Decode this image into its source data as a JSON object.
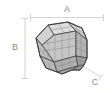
{
  "figure": {
    "background_color": "#ffffff",
    "canvas": {
      "width": 108,
      "height": 91
    }
  },
  "dimensions": {
    "width_label": "A",
    "height_label": "B",
    "depth_label": "C",
    "line_color": "#c9c9c9",
    "label_color": "#8c8c8c",
    "width_label_position": {
      "x": 67,
      "y": 9
    },
    "height_label_position": {
      "x": 15,
      "y": 48
    },
    "depth_label_position": {
      "x": 95,
      "y": 82
    },
    "width_extent": {
      "x1": 30,
      "x2": 104,
      "y": 17
    },
    "height_extent": {
      "y1": 18,
      "y2": 79,
      "x": 25
    },
    "depth_extent": {
      "x1": 79,
      "y1": 64,
      "x2": 100,
      "y2": 76
    }
  },
  "solid": {
    "name": "polyhedron",
    "edge_color": "#4a4a4a",
    "mesh_color": "#7d7d7d",
    "face_fill_light": "#d6d6d6",
    "face_fill_mid": "#c2c2c2",
    "face_fill_dark": "#ababab",
    "face_fill_darkest": "#9a9a9a",
    "center": {
      "x": 63,
      "y": 48
    }
  }
}
